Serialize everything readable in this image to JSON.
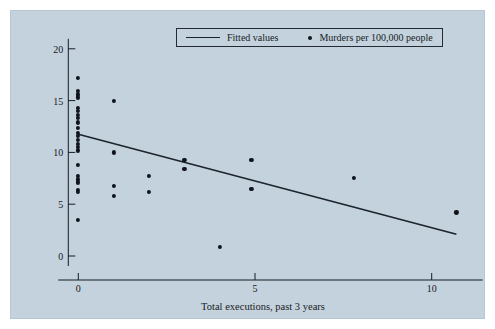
{
  "figure": {
    "background_color": "#c3d2dd",
    "page_color": "#ffffff",
    "ink_color": "#171c24"
  },
  "legend": {
    "fitted_label": "Fitted values",
    "scatter_label": "Murders per 100,000 people"
  },
  "axes": {
    "xlabel": "Total executions, past 3 years",
    "ylabel": "",
    "xticks": [
      "0",
      "5",
      "10"
    ],
    "yticks": [
      "0",
      "5",
      "10",
      "15",
      "20"
    ]
  },
  "chart_data": {
    "type": "scatter",
    "title": "",
    "xlabel": "Total executions, past 3 years",
    "ylabel": "Murders per 100,000 people",
    "xlim": [
      -0.55,
      11.5
    ],
    "ylim": [
      -1.6,
      21.5
    ],
    "xticks": [
      0,
      5,
      10
    ],
    "yticks": [
      0,
      5,
      10,
      15,
      20
    ],
    "grid": false,
    "legend_position": "top-center",
    "series": [
      {
        "name": "Murders per 100,000 people",
        "type": "scatter",
        "marker": "circle",
        "color": "#10141a",
        "points": [
          [
            0.0,
            17.2
          ],
          [
            0.0,
            15.9
          ],
          [
            0.0,
            15.6
          ],
          [
            0.0,
            15.3
          ],
          [
            0.0,
            14.3
          ],
          [
            0.0,
            14.0
          ],
          [
            0.0,
            13.6
          ],
          [
            0.0,
            13.3
          ],
          [
            0.0,
            12.9
          ],
          [
            0.0,
            12.4
          ],
          [
            0.0,
            11.9
          ],
          [
            0.0,
            11.6
          ],
          [
            0.0,
            11.2
          ],
          [
            0.0,
            10.8
          ],
          [
            0.0,
            10.5
          ],
          [
            0.0,
            10.2
          ],
          [
            0.0,
            8.8
          ],
          [
            0.0,
            7.7
          ],
          [
            0.0,
            7.4
          ],
          [
            0.0,
            7.1
          ],
          [
            0.0,
            6.4
          ],
          [
            0.0,
            6.2
          ],
          [
            0.0,
            3.5
          ],
          [
            1.0,
            15.0
          ],
          [
            1.0,
            10.0
          ],
          [
            1.0,
            6.8
          ],
          [
            1.0,
            5.8
          ],
          [
            2.0,
            7.7
          ],
          [
            2.0,
            6.2
          ],
          [
            3.0,
            9.3
          ],
          [
            3.0,
            8.4
          ],
          [
            4.0,
            0.9
          ],
          [
            4.9,
            9.3
          ],
          [
            4.9,
            6.5
          ],
          [
            7.8,
            7.5
          ],
          [
            10.7,
            4.2
          ]
        ]
      },
      {
        "name": "Fitted values",
        "type": "line",
        "color": "#1d242c",
        "x": [
          0.0,
          10.7
        ],
        "y": [
          11.75,
          2.1
        ]
      }
    ]
  }
}
